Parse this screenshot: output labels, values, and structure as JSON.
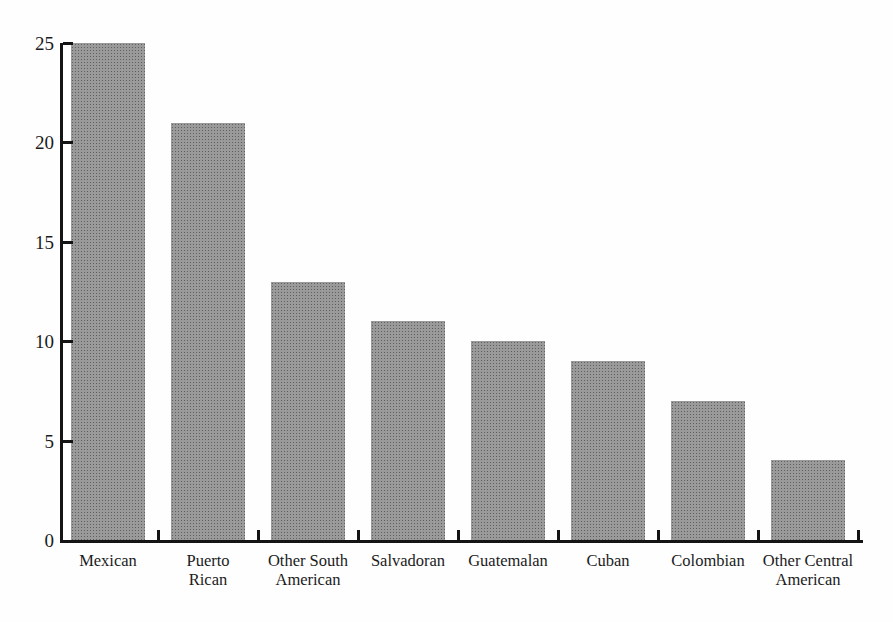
{
  "chart_data": {
    "type": "bar",
    "title": "",
    "xlabel": "",
    "ylabel": "",
    "categories": [
      "Mexican",
      "Puerto Rican",
      "Other South American",
      "Salvadoran",
      "Guatemalan",
      "Cuban",
      "Colombian",
      "Other Central American"
    ],
    "category_labels": [
      "Mexican",
      "Puerto\nRican",
      "Other South\nAmerican",
      "Salvadoran",
      "Guatemalan",
      "Cuban",
      "Colombian",
      "Other Central\nAmerican"
    ],
    "values": [
      25,
      21,
      13,
      11,
      10,
      9,
      7,
      4
    ],
    "ylim": [
      0,
      25
    ],
    "yticks": [
      0,
      5,
      10,
      15,
      20,
      25
    ],
    "grid": false,
    "legend": null,
    "bar_color": "#9a9a9a",
    "bar_dot_color": "#5f5f5f",
    "axis_color": "#141414",
    "text_color": "#1b1b1b",
    "background_color": "#fefefe"
  }
}
